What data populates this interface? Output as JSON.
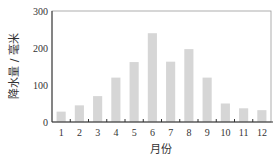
{
  "chart_data": {
    "type": "bar",
    "title": "",
    "xlabel": "月份",
    "ylabel": "降水量 / 毫米",
    "categories": [
      "1",
      "2",
      "3",
      "4",
      "5",
      "6",
      "7",
      "8",
      "9",
      "10",
      "11",
      "12"
    ],
    "values": [
      28,
      45,
      70,
      120,
      162,
      240,
      163,
      197,
      120,
      50,
      37,
      32
    ],
    "ylim": [
      0,
      300
    ],
    "yticks": [
      0,
      100,
      200,
      300
    ],
    "grid": false,
    "bar_color": "#d6d6d6",
    "axis_color": "#333333"
  }
}
